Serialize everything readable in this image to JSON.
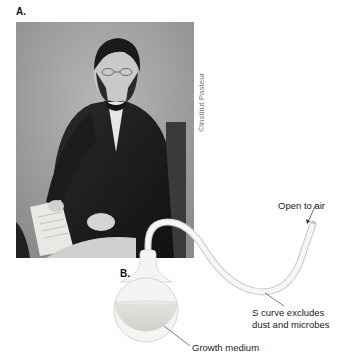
{
  "panels": {
    "a": {
      "label": "A."
    },
    "b": {
      "label": "B."
    }
  },
  "photo": {
    "description": "Black-and-white portrait of a seated man in a dark coat holding papers",
    "credit": "©Institut Pasteur"
  },
  "flask": {
    "callouts": {
      "open_to_air": "Open to air",
      "s_curve_line1": "S curve excludes",
      "s_curve_line2": "dust and microbes",
      "growth_medium": "Growth medium"
    }
  },
  "colors": {
    "background": "#ffffff",
    "glass": "#f4f4f2",
    "glass_outline": "#c8c8c4",
    "medium": "#dcdcd8",
    "leader_line": "#444444"
  }
}
